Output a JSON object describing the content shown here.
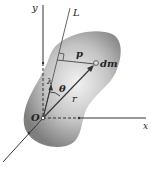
{
  "figure": {
    "labels": {
      "y_axis": "y",
      "x_axis": "x",
      "axis_L": "L",
      "origin": "O",
      "mass_element": "dm",
      "perpendicular_distance": "p",
      "position_vector": "r",
      "angle": "θ",
      "unit_vector": "λ"
    },
    "colors": {
      "body_fill_light": "#e6e6e6",
      "body_fill_dark": "#8a8a8a",
      "lines": "#333333",
      "background": "#ffffff"
    }
  }
}
